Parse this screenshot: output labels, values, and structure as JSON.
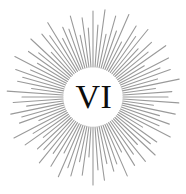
{
  "emblem": {
    "label": "sunburst-emblem",
    "numeral": "VI",
    "numeral_color": "#0d0d0d",
    "numeral_font_size_px": 34,
    "background_color": "#ffffff"
  },
  "chart_data": {
    "type": "scatter",
    "xlabel": "",
    "ylabel": "",
    "center": [
      93,
      97
    ],
    "inner_radius": 30,
    "ray_color": "#9a9a9a",
    "ray_width_px": 1.1,
    "ray_count": 92,
    "outer_radius_min": 54,
    "outer_radius_max": 90,
    "outer_radius_by_index": [
      86,
      72,
      88,
      64,
      84,
      70,
      90,
      62,
      83,
      74,
      87,
      66,
      80,
      71,
      89,
      60,
      85,
      73,
      82,
      67,
      88,
      63,
      79,
      75,
      86,
      61,
      84,
      69,
      81,
      72,
      87,
      58,
      78,
      74,
      85,
      65,
      83,
      70,
      80,
      62,
      86,
      71,
      77,
      68,
      84,
      73,
      88,
      60,
      79,
      66,
      82,
      75,
      87,
      63,
      81,
      69,
      85,
      72,
      76,
      64,
      83,
      70,
      89,
      59,
      78,
      74,
      84,
      67,
      80,
      71,
      86,
      62,
      77,
      73,
      82,
      68,
      88,
      65,
      79,
      70,
      85,
      61,
      81,
      75,
      87,
      66,
      76,
      72,
      84,
      63,
      80,
      69
    ]
  },
  "annotations": {
    "ray_inner_start_note": "rays begin at inner clear circle",
    "numeral_position": "center"
  }
}
